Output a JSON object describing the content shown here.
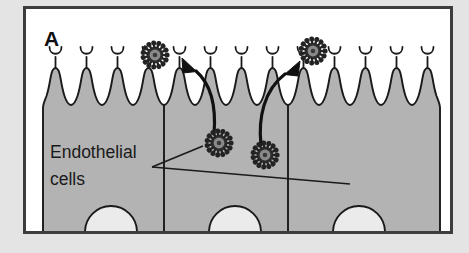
{
  "figure": {
    "panel_label": "A",
    "caption_absent": true,
    "background_color": "#e2e2e2",
    "frame_color": "#3b3b3b",
    "interior_color": "#ffffff",
    "cell_fill_color": "#b3b3b3",
    "outline_color": "#1a1a1a",
    "virus_color": "#2b2b2b",
    "arrow_color": "#111111"
  },
  "annotations": {
    "cell_label": {
      "line1": "Endothelial",
      "line2": "cells"
    }
  },
  "diagram_data": {
    "type": "biological-schematic",
    "subject": "virus transcytosis across endothelial cell layer",
    "cell_layer": {
      "cell_count": 3,
      "nucleus_count": 3,
      "microvilli_count": 14,
      "receptor_tip_shape": "cup"
    },
    "virus_particles": [
      {
        "id": "virus-top-left",
        "state": "bound-to-receptor",
        "location": "apical surface left",
        "x": 155,
        "y": 55
      },
      {
        "id": "virus-top-right",
        "state": "released-at-receptor",
        "location": "apical surface right",
        "x": 313,
        "y": 51
      },
      {
        "id": "virus-interior-left",
        "state": "intracellular",
        "location": "within cell cytoplasm left",
        "x": 219,
        "y": 143
      },
      {
        "id": "virus-interior-right",
        "state": "intracellular",
        "location": "within cell cytoplasm right",
        "x": 265,
        "y": 155
      }
    ],
    "arrows": [
      {
        "id": "arrow-inward",
        "from": "virus-interior-left",
        "to": "virus-top-left",
        "direction": "up-left",
        "meaning": "transport toward apical surface"
      },
      {
        "id": "arrow-outward",
        "from": "virus-interior-right",
        "to": "virus-top-right",
        "direction": "up-right",
        "meaning": "release at apical surface"
      }
    ],
    "leader_lines": [
      {
        "id": "leader-upper",
        "label": "Endothelial cells",
        "points_to": "cell body upper"
      },
      {
        "id": "leader-lower",
        "label": "Endothelial cells",
        "points_to": "cell body lower right"
      }
    ]
  }
}
